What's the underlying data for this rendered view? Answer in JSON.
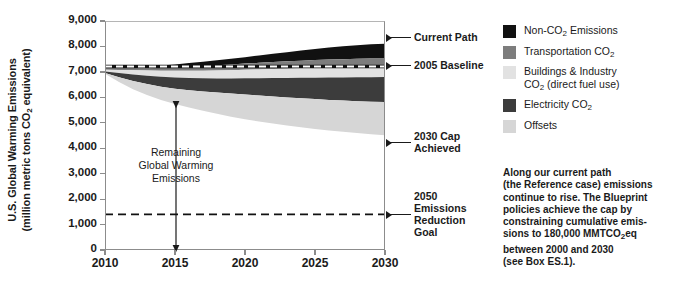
{
  "axis": {
    "y_title_line1": "U.S. Global Warming Emissions",
    "y_title_line2_pre": "(million metric tons CO",
    "y_title_sub": "2",
    "y_title_line2_post": " equivalent)"
  },
  "annotations": {
    "remaining_l1": "Remaining",
    "remaining_l2": "Global Warming",
    "remaining_l3": "Emissions",
    "current_path": "Current Path",
    "baseline_2005": "2005 Baseline",
    "cap_2030_l1": "2030 Cap",
    "cap_2030_l2": "Achieved",
    "goal_2050_l1": "2050",
    "goal_2050_l2": "Emissions",
    "goal_2050_l3": "Reduction",
    "goal_2050_l4": "Goal"
  },
  "legend": {
    "items": [
      {
        "name": "non-co2-emissions",
        "color": "#111111",
        "pre": "Non-CO",
        "sub": "2",
        "post": " Emissions",
        "second": ""
      },
      {
        "name": "transportation-co2",
        "color": "#7d7d7d",
        "pre": "Transportation CO",
        "sub": "2",
        "post": "",
        "second": ""
      },
      {
        "name": "buildings-industry-co2",
        "color": "#e2e2e2",
        "pre": "Buildings & Industry",
        "sub": "",
        "post": "",
        "second": "CO|2| (direct fuel use)"
      },
      {
        "name": "electricity-co2",
        "color": "#3c3c3c",
        "pre": "Electricity CO",
        "sub": "2",
        "post": "",
        "second": ""
      },
      {
        "name": "offsets",
        "color": "#d6d6d6",
        "pre": "Offsets",
        "sub": "",
        "post": "",
        "second": ""
      }
    ]
  },
  "caption": {
    "l1": "Along our current path",
    "l2": "(the Reference case) emissions",
    "l3": "continue to rise. The Blueprint",
    "l4": "policies achieve the cap by",
    "l5": "constraining cumulative emis-",
    "l6_pre": "sions to 180,000 MMTCO",
    "l6_sub": "2",
    "l6_post": "eq",
    "l7": "between 2000 and 2030",
    "l8": "(see Box ES.1)."
  },
  "chart_data": {
    "type": "area",
    "title": "",
    "xlabel": "",
    "ylabel": "U.S. Global Warming Emissions (million metric tons CO2 equivalent)",
    "xlim": [
      2010,
      2030
    ],
    "ylim": [
      0,
      9000
    ],
    "xticks": [
      2010,
      2015,
      2020,
      2025,
      2030
    ],
    "yticks": [
      0,
      1000,
      2000,
      3000,
      4000,
      5000,
      6000,
      7000,
      8000,
      9000
    ],
    "ytick_labels": [
      "0",
      "1,000",
      "2,000",
      "3,000",
      "4,000",
      "5,000",
      "6,000",
      "7,000",
      "8,000",
      "9,000"
    ],
    "xtick_labels": [
      "2010",
      "2015",
      "2020",
      "2025",
      "2030"
    ],
    "grid": false,
    "legend_position": "right",
    "stack_order_top_to_bottom": [
      "Non-CO2 Emissions",
      "Transportation CO2",
      "Buildings & Industry CO2 (direct fuel use)",
      "Electricity CO2",
      "Offsets"
    ],
    "x": [
      2010,
      2011,
      2012,
      2013,
      2014,
      2015,
      2016,
      2017,
      2018,
      2019,
      2020,
      2021,
      2022,
      2023,
      2024,
      2025,
      2026,
      2027,
      2028,
      2029,
      2030
    ],
    "cumulative_top_current_path": [
      7180,
      7190,
      7205,
      7225,
      7255,
      7295,
      7345,
      7400,
      7460,
      7520,
      7580,
      7645,
      7710,
      7775,
      7840,
      7900,
      7955,
      8005,
      8050,
      8085,
      8110
    ],
    "series": [
      {
        "name": "Non-CO2 Emissions",
        "color": "#111111",
        "boundary_lower": [
          7130,
          7130,
          7135,
          7145,
          7160,
          7180,
          7205,
          7235,
          7265,
          7295,
          7325,
          7355,
          7385,
          7415,
          7440,
          7465,
          7485,
          7500,
          7515,
          7525,
          7530
        ]
      },
      {
        "name": "Transportation CO2",
        "color": "#7d7d7d",
        "boundary_lower": [
          7080,
          7070,
          7060,
          7050,
          7045,
          7040,
          7040,
          7045,
          7055,
          7065,
          7080,
          7095,
          7110,
          7125,
          7140,
          7155,
          7165,
          7175,
          7180,
          7185,
          7190
        ]
      },
      {
        "name": "Buildings & Industry CO2 (direct fuel use)",
        "color": "#e2e2e2",
        "boundary_lower": [
          7020,
          6960,
          6900,
          6850,
          6810,
          6780,
          6760,
          6750,
          6745,
          6745,
          6748,
          6752,
          6756,
          6760,
          6765,
          6770,
          6775,
          6780,
          6785,
          6790,
          6795
        ]
      },
      {
        "name": "Electricity CO2",
        "color": "#3c3c3c",
        "boundary_lower": [
          6960,
          6790,
          6640,
          6520,
          6420,
          6340,
          6280,
          6230,
          6190,
          6150,
          6110,
          6070,
          6030,
          5995,
          5960,
          5930,
          5900,
          5875,
          5850,
          5830,
          5815
        ]
      },
      {
        "name": "Offsets",
        "color": "#d6d6d6",
        "boundary_lower": [
          6930,
          6600,
          6320,
          6090,
          5900,
          5740,
          5600,
          5470,
          5350,
          5240,
          5140,
          5050,
          4970,
          4895,
          4825,
          4760,
          4700,
          4645,
          4595,
          4550,
          4510
        ]
      }
    ],
    "reference_lines": [
      {
        "name": "2005 Baseline",
        "value": 7210,
        "style": "dashed",
        "color": "#ffffff",
        "outline": "#111111",
        "label": "2005 Baseline"
      },
      {
        "name": "2050 Emissions Reduction Goal",
        "value": 1400,
        "style": "dashed",
        "color": "#111111",
        "label": "2050 Emissions Reduction Goal"
      }
    ],
    "callouts": [
      {
        "name": "Current Path",
        "y": 8110,
        "x": 2030
      },
      {
        "name": "2005 Baseline",
        "y": 7210,
        "x": 2030
      },
      {
        "name": "2030 Cap Achieved",
        "y": 4510,
        "x": 2030
      },
      {
        "name": "2050 Emissions Reduction Goal",
        "y": 1400,
        "x": 2030
      }
    ],
    "span_annotation": {
      "label": "Remaining Global Warming Emissions",
      "x": 2015.5,
      "from": 0,
      "to": 5740
    }
  }
}
